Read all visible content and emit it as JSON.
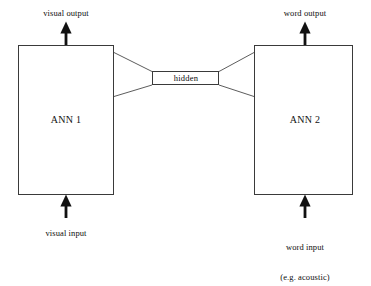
{
  "figure": {
    "type": "block-diagram",
    "background_color": "#ffffff",
    "stroke_color": "#1a1a1a",
    "text_color": "#0d0d0d"
  },
  "modules": [
    {
      "id": "ann1",
      "label": "ANN 1",
      "input_label": "visual input",
      "output_label": "visual output",
      "x": 18,
      "y": 45,
      "width": 96,
      "height": 150
    },
    {
      "id": "ann2",
      "label": "ANN 2",
      "label_extra": "",
      "input_label": "word input",
      "input_label_line2": "(e.g. acoustic)",
      "output_label": "word output",
      "x": 254,
      "y": 45,
      "width": 99,
      "height": 150
    }
  ],
  "hidden_layer": {
    "label": "hidden",
    "x": 152,
    "y": 71,
    "width": 67,
    "height": 14
  },
  "connections": {
    "description": "bowtie fan from each module edge converging on hidden layer",
    "left_top_from_y": 52,
    "left_bottom_from_y": 96,
    "right_top_from_y": 52,
    "right_bottom_from_y": 96
  },
  "arrows": [
    {
      "id": "visual-output-arrow",
      "direction": "up",
      "x": 66,
      "tip_y": 22,
      "tail_y": 45
    },
    {
      "id": "word-output-arrow",
      "direction": "up",
      "x": 305,
      "tip_y": 22,
      "tail_y": 45
    },
    {
      "id": "visual-input-arrow",
      "direction": "up",
      "x": 66,
      "tip_y": 195,
      "tail_y": 218
    },
    {
      "id": "word-input-arrow",
      "direction": "up",
      "x": 305,
      "tip_y": 195,
      "tail_y": 218
    }
  ]
}
